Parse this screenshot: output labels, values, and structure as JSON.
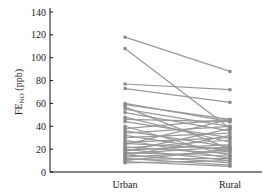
{
  "chart_data": {
    "type": "line",
    "title": "",
    "xlabel": "",
    "ylabel": "FE",
    "ylabel_sub": "NO",
    "ylabel_unit": " (ppb)",
    "categories": [
      "Urban",
      "Rural"
    ],
    "ylim": [
      0,
      140
    ],
    "yticks": [
      0,
      20,
      40,
      60,
      80,
      100,
      120,
      140
    ],
    "grid": false,
    "legend": null,
    "line_color": "#999999",
    "marker_color": "#888888",
    "pairs": [
      [
        118,
        88
      ],
      [
        108,
        38
      ],
      [
        77,
        72
      ],
      [
        73,
        61
      ],
      [
        60,
        44
      ],
      [
        59,
        46
      ],
      [
        57,
        20
      ],
      [
        55,
        40
      ],
      [
        52,
        36
      ],
      [
        48,
        26
      ],
      [
        46,
        44
      ],
      [
        44,
        30
      ],
      [
        40,
        14
      ],
      [
        38,
        46
      ],
      [
        36,
        22
      ],
      [
        34,
        40
      ],
      [
        32,
        18
      ],
      [
        30,
        34
      ],
      [
        28,
        12
      ],
      [
        26,
        30
      ],
      [
        25,
        20
      ],
      [
        24,
        46
      ],
      [
        22,
        16
      ],
      [
        21,
        28
      ],
      [
        20,
        10
      ],
      [
        19,
        24
      ],
      [
        18,
        38
      ],
      [
        17,
        14
      ],
      [
        16,
        22
      ],
      [
        15,
        8
      ],
      [
        14,
        32
      ],
      [
        13,
        18
      ],
      [
        12,
        6
      ],
      [
        11,
        12
      ],
      [
        10,
        20
      ],
      [
        9,
        5
      ],
      [
        8,
        10
      ]
    ]
  }
}
